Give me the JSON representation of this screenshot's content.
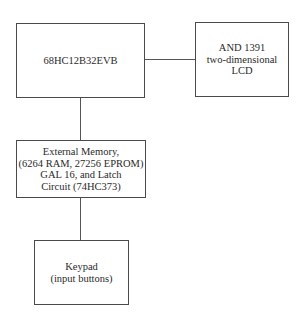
{
  "diagram": {
    "type": "block-diagram",
    "nodes": [
      {
        "id": "mcu",
        "label": "68HC12B32EVB"
      },
      {
        "id": "lcd",
        "label": "AND 1391\ntwo-dimensional\nLCD"
      },
      {
        "id": "memory",
        "label": "External Memory,\n(6264 RAM, 27256 EPROM)\nGAL 16, and Latch\nCircuit (74HC373)"
      },
      {
        "id": "keypad",
        "label": "Keypad\n(input buttons)"
      }
    ],
    "edges": [
      {
        "from": "mcu",
        "to": "lcd"
      },
      {
        "from": "mcu",
        "to": "memory"
      },
      {
        "from": "memory",
        "to": "keypad"
      }
    ]
  }
}
